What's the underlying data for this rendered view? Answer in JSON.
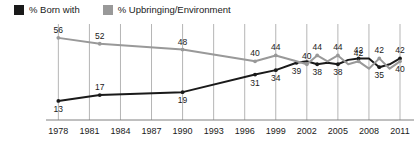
{
  "legend": {
    "items": [
      {
        "label": "% Born with",
        "color": "#1a1a1a",
        "icon": "square-swatch-icon"
      },
      {
        "label": "% Upbringing/Environment",
        "color": "#999999",
        "icon": "square-swatch-icon"
      }
    ]
  },
  "chart_data": {
    "type": "line",
    "title": "",
    "subtitle": "",
    "xlabel": "",
    "ylabel": "",
    "grid": "vertical",
    "legend_position": "top-left",
    "xlim": [
      1977,
      2011
    ],
    "ylim": [
      0,
      60
    ],
    "x_ticks": [
      1978,
      1981,
      1984,
      1987,
      1990,
      1993,
      1996,
      1999,
      2002,
      2005,
      2008,
      2011
    ],
    "series": [
      {
        "name": "% Born with",
        "color": "#1a1a1a",
        "x": [
          1978,
          1982,
          1990,
          1997,
          1999,
          2001,
          2002,
          2003,
          2004,
          2005,
          2006,
          2007,
          2008,
          2009,
          2010,
          2011
        ],
        "values": [
          13,
          17,
          19,
          31,
          34,
          39,
          40,
          38,
          39,
          38,
          41,
          42,
          42,
          36,
          38,
          42
        ],
        "labels": [
          {
            "x": 1978,
            "value": 13,
            "position": "below"
          },
          {
            "x": 1982,
            "value": 17,
            "position": "above"
          },
          {
            "x": 1990,
            "value": 19,
            "position": "below"
          },
          {
            "x": 1997,
            "value": 31,
            "position": "below"
          },
          {
            "x": 1999,
            "value": 34,
            "position": "below"
          },
          {
            "x": 2001,
            "value": 39,
            "position": "below"
          },
          {
            "x": 2003,
            "value": 38,
            "position": "below"
          },
          {
            "x": 2005,
            "value": 38,
            "position": "below"
          },
          {
            "x": 2007,
            "value": 42,
            "position": "above"
          },
          {
            "x": 2009,
            "value": 35,
            "position": "below"
          },
          {
            "x": 2011,
            "value": 42,
            "position": "above"
          }
        ]
      },
      {
        "name": "% Upbringing/Environment",
        "color": "#999999",
        "x": [
          1978,
          1982,
          1990,
          1997,
          1999,
          2001,
          2002,
          2003,
          2004,
          2005,
          2006,
          2007,
          2008,
          2009,
          2010,
          2011
        ],
        "values": [
          56,
          52,
          48,
          40,
          44,
          40,
          38,
          44,
          40,
          44,
          38,
          40,
          35,
          42,
          35,
          40
        ],
        "labels": [
          {
            "x": 1978,
            "value": 56,
            "position": "above"
          },
          {
            "x": 1982,
            "value": 52,
            "position": "above"
          },
          {
            "x": 1990,
            "value": 48,
            "position": "above"
          },
          {
            "x": 1997,
            "value": 40,
            "position": "above"
          },
          {
            "x": 1999,
            "value": 44,
            "position": "above"
          },
          {
            "x": 2002,
            "value": 40,
            "position": "above"
          },
          {
            "x": 2003,
            "value": 44,
            "position": "above"
          },
          {
            "x": 2005,
            "value": 44,
            "position": "above"
          },
          {
            "x": 2007,
            "value": 42,
            "position": "above"
          },
          {
            "x": 2009,
            "value": 42,
            "position": "above"
          },
          {
            "x": 2011,
            "value": 40,
            "position": "below"
          }
        ]
      }
    ]
  },
  "axis": {
    "tick_labels": [
      "1978",
      "1981",
      "1984",
      "1987",
      "1990",
      "1993",
      "1996",
      "1999",
      "2002",
      "2005",
      "2008",
      "2011"
    ]
  },
  "colors": {
    "born_with": "#1a1a1a",
    "upbringing": "#999999",
    "gridline": "#b5b5b5",
    "axis": "#808080",
    "background": "#ffffff"
  }
}
